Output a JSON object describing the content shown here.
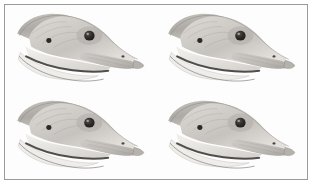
{
  "image": {
    "title": "Goose head profile study",
    "medium": "graphite pencil drawing",
    "subject": "waterfowl head in right-facing profile",
    "layout": "2x2 repeated tile grid",
    "tile_count": 4,
    "frame": {
      "visible": true,
      "border_color": "#9a9a9a",
      "background_color": "#ffffff"
    },
    "palette": {
      "paper": "#fdfdfd",
      "light_shade": "#e6e4e1",
      "mid_shade": "#c3c0bb",
      "dark_shade": "#9b9792",
      "deep_shade": "#6f6b66",
      "outline": "#57534e",
      "eye": "#2b2926",
      "mouth_line": "#3a3835"
    },
    "features": [
      {
        "name": "crown",
        "label": "Crown"
      },
      {
        "name": "eye",
        "label": "Eye"
      },
      {
        "name": "ear-spot",
        "label": "Ear spot"
      },
      {
        "name": "bill",
        "label": "Bill"
      },
      {
        "name": "nostril",
        "label": "Nostril"
      },
      {
        "name": "mouth-line",
        "label": "Mouth line"
      },
      {
        "name": "throat",
        "label": "Throat"
      },
      {
        "name": "nape",
        "label": "Nape"
      }
    ]
  },
  "tiles": [
    {
      "id": "tile-1",
      "position": "top-left",
      "row": 1,
      "col": 1,
      "label": "Goose head profile"
    },
    {
      "id": "tile-2",
      "position": "top-right",
      "row": 1,
      "col": 2,
      "label": "Goose head profile"
    },
    {
      "id": "tile-3",
      "position": "bottom-left",
      "row": 2,
      "col": 1,
      "label": "Goose head profile"
    },
    {
      "id": "tile-4",
      "position": "bottom-right",
      "row": 2,
      "col": 2,
      "label": "Goose head profile"
    }
  ]
}
